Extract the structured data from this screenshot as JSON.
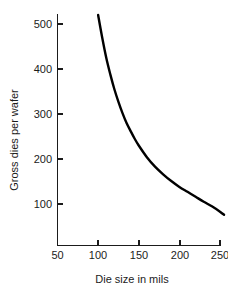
{
  "chart_data": {
    "type": "line",
    "title": "",
    "subtitle": "",
    "xlabel": "Die size in mils",
    "ylabel": "Gross dies per wafer",
    "xlim": [
      50,
      258
    ],
    "ylim": [
      0,
      545
    ],
    "xticks": [
      50,
      100,
      150,
      200,
      250
    ],
    "yticks": [
      100,
      200,
      300,
      400,
      500
    ],
    "xtick_labels": [
      "50",
      "100",
      "150",
      "200",
      "250"
    ],
    "ytick_labels": [
      "100",
      "200",
      "300",
      "400",
      "500"
    ],
    "grid": false,
    "legend": false,
    "legend_position": "none",
    "series": [
      {
        "name": "Gross dies per wafer",
        "color": "#000000",
        "x": [
          100,
          105,
          110,
          115,
          120,
          125,
          130,
          135,
          140,
          145,
          150,
          160,
          170,
          180,
          190,
          200,
          210,
          220,
          230,
          240,
          250,
          255
        ],
        "y": [
          520,
          470,
          425,
          388,
          355,
          327,
          302,
          280,
          262,
          245,
          230,
          204,
          183,
          166,
          151,
          138,
          127,
          116,
          105,
          95,
          83,
          76
        ]
      }
    ],
    "annotations": []
  },
  "axes": {
    "y_axis_label": "Gross dies per wafer",
    "x_axis_label": "Die size in mils",
    "y_tick_0": "100",
    "y_tick_1": "200",
    "y_tick_2": "300",
    "y_tick_3": "400",
    "y_tick_4": "500",
    "x_tick_0": "50",
    "x_tick_1": "100",
    "x_tick_2": "150",
    "x_tick_3": "200",
    "x_tick_4": "250"
  },
  "colors": {
    "background": "#ffffff",
    "curve": "#000000",
    "axis": "#1b1b1b",
    "text": "#1b1b1b"
  }
}
